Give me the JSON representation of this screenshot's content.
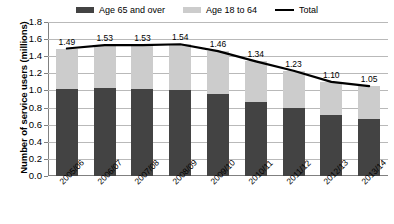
{
  "chart_data": {
    "type": "bar",
    "subtype": "stacked-bar-with-line",
    "title": "",
    "xlabel": "",
    "ylabel": "Number of service users (millions)",
    "ylim": [
      0.0,
      1.8
    ],
    "ytick_labels": [
      "1.8",
      "1.6",
      "1.4",
      "1.2",
      "1.0",
      "0.8",
      "0.6",
      "0.4",
      "0.2",
      "0.0"
    ],
    "ytick_values": [
      1.8,
      1.6,
      1.4,
      1.2,
      1.0,
      0.8,
      0.6,
      0.4,
      0.2,
      0.0
    ],
    "grid": true,
    "legend_position": "top-center",
    "categories": [
      "2005/06",
      "2006/07",
      "2007/08",
      "2008/09",
      "2009/10",
      "2010/11",
      "2011/12",
      "2012/13",
      "2013/14"
    ],
    "series": [
      {
        "name": "Age 65 and over",
        "type": "bar",
        "color": "#434343",
        "values": [
          1.02,
          1.03,
          1.02,
          1.01,
          0.96,
          0.87,
          0.8,
          0.71,
          0.67
        ]
      },
      {
        "name": "Age 18 to 64",
        "type": "bar",
        "color": "#cccccc",
        "values": [
          0.47,
          0.5,
          0.51,
          0.53,
          0.5,
          0.47,
          0.43,
          0.39,
          0.38
        ]
      },
      {
        "name": "Total",
        "type": "line",
        "color": "#000000",
        "values": [
          1.49,
          1.53,
          1.53,
          1.54,
          1.46,
          1.34,
          1.23,
          1.1,
          1.05
        ],
        "data_labels": [
          "1.49",
          "1.53",
          "1.53",
          "1.54",
          "1.46",
          "1.34",
          "1.23",
          "1.10",
          "1.05"
        ]
      }
    ]
  },
  "legend": {
    "items": [
      {
        "label": "Age 65 and over",
        "swatch": "bar-swatch-dark",
        "color": "#434343"
      },
      {
        "label": "Age 18 to 64",
        "swatch": "bar-swatch-light",
        "color": "#cccccc"
      },
      {
        "label": "Total",
        "swatch": "line-swatch-black",
        "color": "#000000"
      }
    ]
  }
}
